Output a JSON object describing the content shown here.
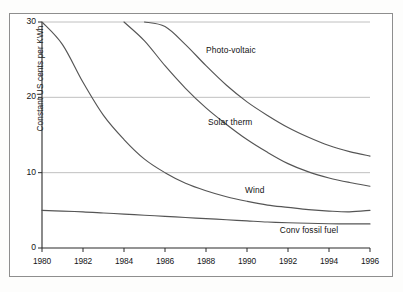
{
  "chart_data": {
    "type": "line",
    "title": "",
    "xlabel": "",
    "ylabel": "Constant  US cents per KWh",
    "xlim": [
      1980,
      1996
    ],
    "ylim": [
      0,
      30
    ],
    "grid": true,
    "legend_position": "inline-labels",
    "x_ticks": [
      "1980",
      "1982",
      "1984",
      "1986",
      "1988",
      "1990",
      "1992",
      "1994",
      "1996"
    ],
    "y_ticks": [
      "0",
      "10",
      "20",
      "30"
    ],
    "x": [
      1980,
      1981,
      1982,
      1983,
      1984,
      1985,
      1986,
      1987,
      1988,
      1989,
      1990,
      1991,
      1992,
      1993,
      1994,
      1995,
      1996
    ],
    "series": [
      {
        "name": "Photo-voltaic",
        "label": "Photo-voltaic",
        "color": "#555555",
        "values": [
          null,
          null,
          null,
          null,
          null,
          30.0,
          29.4,
          27.0,
          24.2,
          21.6,
          19.4,
          17.6,
          16.0,
          14.7,
          13.6,
          12.8,
          12.2
        ]
      },
      {
        "name": "Solar therm",
        "label": "Solar therm",
        "color": "#555555",
        "values": [
          null,
          null,
          null,
          null,
          30.0,
          27.5,
          24.2,
          21.2,
          18.6,
          16.4,
          14.4,
          12.7,
          11.2,
          10.1,
          9.3,
          8.7,
          8.2
        ]
      },
      {
        "name": "Wind",
        "label": "Wind",
        "color": "#555555",
        "values": [
          30.0,
          27.0,
          22.0,
          17.6,
          14.4,
          11.8,
          10.0,
          8.6,
          7.6,
          6.8,
          6.2,
          5.7,
          5.4,
          5.1,
          4.9,
          4.8,
          5.0
        ]
      },
      {
        "name": "Conv fossil fuel",
        "label": "Conv fossil fuel",
        "color": "#555555",
        "values": [
          5.0,
          4.9,
          4.8,
          4.65,
          4.5,
          4.35,
          4.2,
          4.05,
          3.9,
          3.75,
          3.6,
          3.45,
          3.35,
          3.28,
          3.22,
          3.2,
          3.2
        ]
      }
    ],
    "annotations": [
      {
        "text": "Photo-voltaic",
        "x": 1988.0,
        "y": 26.2
      },
      {
        "text": "Solar therm",
        "x": 1988.1,
        "y": 16.6
      },
      {
        "text": "Wind",
        "x": 1989.9,
        "y": 7.6
      },
      {
        "text": "Conv fossil fuel",
        "x": 1991.6,
        "y": 2.3
      }
    ]
  },
  "axes": {
    "y_title": "Constant  US cents per KWh",
    "y_ticks": [
      {
        "label": "30",
        "value": 30
      },
      {
        "label": "20",
        "value": 20
      },
      {
        "label": "10",
        "value": 10
      },
      {
        "label": "0",
        "value": 0
      }
    ],
    "x_ticks": [
      {
        "label": "1980",
        "value": 1980
      },
      {
        "label": "1982",
        "value": 1982
      },
      {
        "label": "1984",
        "value": 1984
      },
      {
        "label": "1986",
        "value": 1986
      },
      {
        "label": "1988",
        "value": 1988
      },
      {
        "label": "1990",
        "value": 1990
      },
      {
        "label": "1992",
        "value": 1992
      },
      {
        "label": "1994",
        "value": 1994
      },
      {
        "label": "1996",
        "value": 1996
      }
    ]
  },
  "colors": {
    "curve": "#555555",
    "gridline": "#b9b9b9",
    "axis": "#2b2b2b",
    "frame": "#8e8e8e",
    "background": "#ffffff"
  }
}
